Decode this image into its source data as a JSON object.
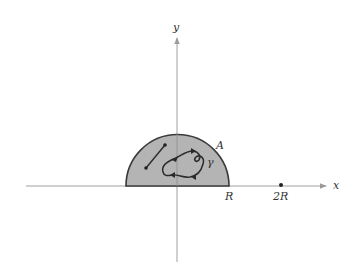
{
  "figure": {
    "colors": {
      "background": "#ffffff",
      "axis": "#9a9a9a",
      "region_fill": "#b4b4b4",
      "region_stroke": "#3a3a3a",
      "curve": "#2a2a2a"
    },
    "axes": {
      "x_label": "x",
      "y_label": "y"
    },
    "region": {
      "label": "A",
      "shape": "upper half-disk of radius R centered at origin"
    },
    "curve": {
      "label": "γ"
    },
    "ticks": {
      "r_label": "R",
      "two_r_label": "2R"
    },
    "segment": {
      "description": "line segment inside region A"
    }
  }
}
